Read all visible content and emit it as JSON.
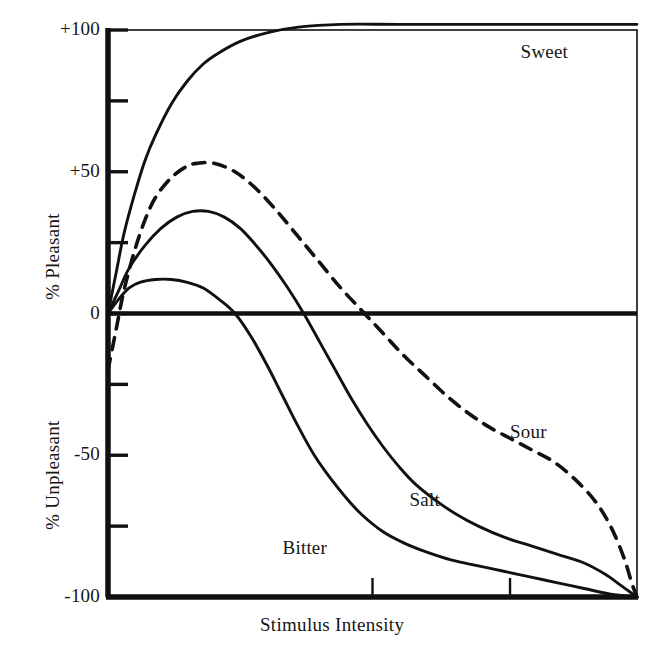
{
  "chart_data": {
    "type": "line",
    "title": "",
    "xlabel": "Stimulus Intensity",
    "ylabel_upper": "% Pleasant",
    "ylabel_lower": "% Unpleasant",
    "xlim": [
      0,
      100
    ],
    "ylim": [
      -100,
      100
    ],
    "grid": false,
    "legend_position": "inline-annotations",
    "y_ticks": [
      {
        "value": 100,
        "label": "+100"
      },
      {
        "value": 75,
        "label": ""
      },
      {
        "value": 50,
        "label": "+50"
      },
      {
        "value": 25,
        "label": ""
      },
      {
        "value": 0,
        "label": "0"
      },
      {
        "value": -25,
        "label": ""
      },
      {
        "value": -50,
        "label": "-50"
      },
      {
        "value": -75,
        "label": ""
      },
      {
        "value": -100,
        "label": "-100"
      }
    ],
    "x_ticks": [
      {
        "value": 50
      },
      {
        "value": 76
      }
    ],
    "zero_line": 0,
    "series": [
      {
        "name": "Sweet",
        "style": "solid",
        "color": "#111111",
        "label_x": 78,
        "label_y": 92,
        "points": [
          [
            0,
            0
          ],
          [
            1.5,
            14
          ],
          [
            3,
            28
          ],
          [
            5,
            42
          ],
          [
            7,
            54
          ],
          [
            9,
            63
          ],
          [
            12,
            74
          ],
          [
            15,
            82
          ],
          [
            18,
            88
          ],
          [
            21,
            92
          ],
          [
            25,
            96
          ],
          [
            30,
            99
          ],
          [
            36,
            101
          ],
          [
            44,
            102
          ],
          [
            55,
            102
          ],
          [
            70,
            102
          ],
          [
            85,
            102
          ],
          [
            100,
            102
          ]
        ]
      },
      {
        "name": "Sour",
        "style": "dashed",
        "color": "#111111",
        "label_x": 76,
        "label_y": -42,
        "points": [
          [
            0,
            -20
          ],
          [
            1.5,
            -6
          ],
          [
            3,
            8
          ],
          [
            5,
            22
          ],
          [
            7,
            33
          ],
          [
            9,
            41
          ],
          [
            12,
            48
          ],
          [
            15,
            52
          ],
          [
            17,
            53
          ],
          [
            20,
            53
          ],
          [
            24,
            50
          ],
          [
            28,
            44
          ],
          [
            32,
            36
          ],
          [
            36,
            27
          ],
          [
            40,
            18
          ],
          [
            44,
            9
          ],
          [
            48,
            1
          ],
          [
            52,
            -7
          ],
          [
            56,
            -15
          ],
          [
            60,
            -22
          ],
          [
            64,
            -29
          ],
          [
            68,
            -35
          ],
          [
            72,
            -40
          ],
          [
            76,
            -44
          ],
          [
            80,
            -48
          ],
          [
            84,
            -52
          ],
          [
            88,
            -58
          ],
          [
            92,
            -66
          ],
          [
            95,
            -75
          ],
          [
            97.5,
            -86
          ],
          [
            99,
            -95
          ],
          [
            100,
            -100
          ]
        ]
      },
      {
        "name": "Salt",
        "style": "solid",
        "color": "#111111",
        "label_x": 57,
        "label_y": -66,
        "points": [
          [
            0,
            0
          ],
          [
            2,
            8
          ],
          [
            4,
            16
          ],
          [
            7,
            24
          ],
          [
            10,
            30
          ],
          [
            13,
            34
          ],
          [
            16,
            36
          ],
          [
            19,
            36
          ],
          [
            22,
            34
          ],
          [
            25,
            30
          ],
          [
            28,
            24
          ],
          [
            31,
            17
          ],
          [
            34,
            9
          ],
          [
            37,
            0
          ],
          [
            40,
            -10
          ],
          [
            43,
            -20
          ],
          [
            46,
            -30
          ],
          [
            49,
            -39
          ],
          [
            52,
            -47
          ],
          [
            55,
            -54
          ],
          [
            58,
            -60
          ],
          [
            62,
            -66
          ],
          [
            66,
            -71
          ],
          [
            70,
            -75
          ],
          [
            75,
            -79
          ],
          [
            80,
            -82
          ],
          [
            85,
            -85
          ],
          [
            90,
            -88
          ],
          [
            94,
            -92
          ],
          [
            97,
            -96
          ],
          [
            100,
            -100
          ]
        ]
      },
      {
        "name": "Bitter",
        "style": "solid",
        "color": "#111111",
        "label_x": 33,
        "label_y": -83,
        "points": [
          [
            0,
            0
          ],
          [
            2,
            5
          ],
          [
            4,
            9
          ],
          [
            6,
            11
          ],
          [
            9,
            12
          ],
          [
            12,
            12
          ],
          [
            15,
            11
          ],
          [
            18,
            9
          ],
          [
            21,
            5
          ],
          [
            24,
            0
          ],
          [
            27,
            -8
          ],
          [
            30,
            -18
          ],
          [
            33,
            -29
          ],
          [
            36,
            -40
          ],
          [
            39,
            -50
          ],
          [
            42,
            -58
          ],
          [
            45,
            -65
          ],
          [
            48,
            -71
          ],
          [
            52,
            -77
          ],
          [
            56,
            -81
          ],
          [
            60,
            -84
          ],
          [
            65,
            -87
          ],
          [
            70,
            -89
          ],
          [
            75,
            -91
          ],
          [
            80,
            -93
          ],
          [
            85,
            -95
          ],
          [
            90,
            -97
          ],
          [
            95,
            -99
          ],
          [
            100,
            -100
          ]
        ]
      }
    ]
  }
}
